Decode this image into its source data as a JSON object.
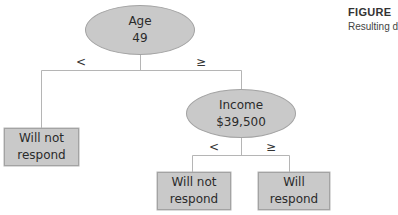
{
  "figure": {
    "label": "FIGURE",
    "caption": "Resulting d"
  },
  "tree": {
    "root": {
      "line1": "Age",
      "line2": "49"
    },
    "root_branches": {
      "left": "<",
      "right": "≥"
    },
    "left_leaf": {
      "line1": "Will not",
      "line2": "respond"
    },
    "income_node": {
      "line1": "Income",
      "line2": "$39,500"
    },
    "income_branches": {
      "left": "<",
      "right": "≥"
    },
    "income_left_leaf": {
      "line1": "Will not",
      "line2": "respond"
    },
    "income_right_leaf": {
      "label": "Will respond"
    }
  },
  "colors": {
    "node_fill": "#c9c9c9",
    "node_border": "#a3a3a3",
    "connector": "#b5b5b5"
  }
}
